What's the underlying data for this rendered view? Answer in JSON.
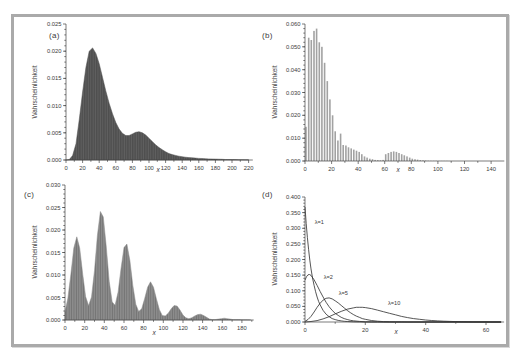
{
  "figure": {
    "background_color": "#ffffff",
    "frame_color": "#aaaaaa",
    "axis_color": "#444444",
    "text_color": "#3a3a3a"
  },
  "chart_data": [
    {
      "id": "a",
      "panel_label": "(a)",
      "type": "bar",
      "render": "area",
      "xlabel": "x",
      "ylabel": "Wahrscheinlichkeit",
      "xlim": [
        0,
        225
      ],
      "ylim": [
        0,
        0.025
      ],
      "xticks": [
        0,
        20,
        40,
        60,
        80,
        100,
        120,
        140,
        160,
        180,
        200,
        220
      ],
      "xticklabels": [
        "0",
        "20",
        "40",
        "60",
        "80",
        "100",
        "120",
        "140",
        "160",
        "180",
        "200",
        "220"
      ],
      "yticks": [
        0,
        0.005,
        0.01,
        0.015,
        0.02,
        0.025
      ],
      "yticklabels": [
        "0.000",
        "0.005",
        "0.010",
        "0.015",
        "0.020",
        "0.025"
      ],
      "bar_color": "#4f4f4f",
      "bar_stripe_color": "#636363",
      "x_step": 4,
      "x": [
        0,
        4,
        8,
        12,
        16,
        20,
        24,
        28,
        32,
        36,
        40,
        44,
        48,
        52,
        56,
        60,
        64,
        68,
        72,
        76,
        80,
        84,
        88,
        92,
        96,
        100,
        104,
        108,
        112,
        116,
        120,
        124,
        128,
        132,
        136,
        140,
        144,
        148,
        152,
        156,
        160,
        164,
        168,
        172,
        176,
        180,
        184,
        188,
        192,
        196,
        200,
        204,
        208,
        212,
        216,
        220
      ],
      "y": [
        0,
        0.0001,
        0.0008,
        0.003,
        0.0075,
        0.0125,
        0.017,
        0.02,
        0.0206,
        0.0196,
        0.0177,
        0.0152,
        0.0127,
        0.0104,
        0.0085,
        0.0069,
        0.0057,
        0.0049,
        0.0045,
        0.0045,
        0.0048,
        0.0051,
        0.0052,
        0.005,
        0.0046,
        0.004,
        0.0034,
        0.0028,
        0.0023,
        0.0019,
        0.0015,
        0.0012,
        0.001,
        0.00085,
        0.0007,
        0.0006,
        0.00052,
        0.00045,
        0.0004,
        0.00035,
        0.0003,
        0.00027,
        0.00024,
        0.00021,
        0.00018,
        0.00016,
        0.00014,
        0.00012,
        0.0001,
        9e-05,
        8e-05,
        7e-05,
        6e-05,
        5e-05,
        4e-05,
        3e-05
      ]
    },
    {
      "id": "b",
      "panel_label": "(b)",
      "type": "bar",
      "render": "bars",
      "xlabel": "x",
      "ylabel": "Wahrscheinlichkeit",
      "xlim": [
        0,
        150
      ],
      "ylim": [
        0,
        0.06
      ],
      "xticks": [
        0,
        20,
        40,
        60,
        80,
        100,
        120,
        140
      ],
      "xticklabels": [
        "0",
        "20",
        "40",
        "60",
        "80",
        "100",
        "120",
        "140"
      ],
      "yticks": [
        0,
        0.01,
        0.02,
        0.03,
        0.04,
        0.05,
        0.06
      ],
      "yticklabels": [
        "0.000",
        "0.010",
        "0.020",
        "0.030",
        "0.040",
        "0.050",
        "0.060"
      ],
      "bar_color": "#a2a2a2",
      "x_step": 2,
      "x": [
        0,
        2,
        4,
        6,
        8,
        10,
        12,
        14,
        16,
        18,
        20,
        22,
        24,
        26,
        28,
        30,
        32,
        34,
        36,
        38,
        40,
        42,
        44,
        46,
        48,
        50,
        52,
        54,
        56,
        58,
        60,
        62,
        64,
        66,
        68,
        70,
        72,
        74,
        76,
        78,
        80,
        82,
        84,
        86,
        88,
        90,
        92,
        94,
        96,
        98,
        100,
        102,
        104,
        106,
        108,
        110,
        112,
        114,
        116,
        118,
        120,
        122,
        124,
        126,
        128,
        130,
        132,
        134,
        136,
        138,
        140,
        142,
        144,
        146,
        148,
        150
      ],
      "y": [
        0.015,
        0.054,
        0.053,
        0.057,
        0.058,
        0.052,
        0.05,
        0.043,
        0.035,
        0.027,
        0.02,
        0.013,
        0.009,
        0.012,
        0.007,
        0.0068,
        0.006,
        0.0055,
        0.005,
        0.0045,
        0.004,
        0.003,
        0.002,
        0.0015,
        0.001,
        0.0008,
        0.0005,
        0.0004,
        0.0003,
        0.0005,
        0.003,
        0.0035,
        0.004,
        0.0042,
        0.004,
        0.0035,
        0.003,
        0.0025,
        0.002,
        0.0015,
        0.001,
        0.0008,
        0.0006,
        0.0004,
        0.0003,
        0.0002,
        0.00015,
        0.0001,
        0.0001,
        8e-05,
        6e-05,
        5e-05,
        4e-05,
        3e-05,
        2e-05,
        2e-05,
        1e-05,
        1e-05,
        0,
        0,
        0,
        0,
        0,
        0,
        0,
        0,
        0,
        0,
        0,
        0,
        0,
        0,
        0,
        0,
        0,
        0
      ]
    },
    {
      "id": "c",
      "panel_label": "(c)",
      "type": "bar",
      "render": "area",
      "xlabel": "x",
      "ylabel": "Wahrscheinlichkeit",
      "xlim": [
        0,
        192
      ],
      "ylim": [
        0,
        0.03
      ],
      "xticks": [
        0,
        20,
        40,
        60,
        80,
        100,
        120,
        140,
        160,
        180
      ],
      "xticklabels": [
        "0",
        "20",
        "40",
        "60",
        "80",
        "100",
        "120",
        "140",
        "160",
        "180"
      ],
      "yticks": [
        0,
        0.005,
        0.01,
        0.015,
        0.02,
        0.025,
        0.03
      ],
      "yticklabels": [
        "0.000",
        "0.005",
        "0.010",
        "0.015",
        "0.020",
        "0.025",
        "0.030"
      ],
      "bar_color": "#8d8d8d",
      "bar_stripe_color": "#6f6f6f",
      "x_step": 3,
      "x": [
        0,
        3,
        6,
        9,
        12,
        15,
        18,
        21,
        24,
        27,
        30,
        33,
        36,
        39,
        42,
        45,
        48,
        51,
        54,
        57,
        60,
        63,
        66,
        69,
        72,
        75,
        78,
        81,
        84,
        87,
        90,
        93,
        96,
        99,
        102,
        105,
        108,
        111,
        114,
        117,
        120,
        123,
        126,
        129,
        132,
        135,
        138,
        141,
        144,
        147,
        150,
        153,
        156,
        159,
        162,
        165,
        168,
        171,
        174,
        177,
        180,
        183,
        186,
        189
      ],
      "y": [
        0.0017,
        0.0049,
        0.0102,
        0.016,
        0.0185,
        0.016,
        0.0102,
        0.0052,
        0.0032,
        0.0051,
        0.011,
        0.0188,
        0.0241,
        0.0229,
        0.0162,
        0.0086,
        0.004,
        0.0033,
        0.0062,
        0.0114,
        0.0161,
        0.0169,
        0.0132,
        0.0077,
        0.0035,
        0.0019,
        0.0025,
        0.0047,
        0.0073,
        0.0085,
        0.0073,
        0.0047,
        0.0023,
        0.001,
        0.0009,
        0.0015,
        0.0025,
        0.0032,
        0.0031,
        0.0022,
        0.0011,
        0.0005,
        0.0003,
        0.0005,
        0.0009,
        0.0012,
        0.0013,
        0.001,
        0.0006,
        0.0002,
        0.0001,
        0.0001,
        0.0002,
        0.0003,
        0.0004,
        0.0003,
        0.0002,
        0.0001,
        0.0001,
        8e-05,
        6e-05,
        5e-05,
        4e-05,
        3e-05
      ]
    },
    {
      "id": "d",
      "panel_label": "(d)",
      "type": "line",
      "render": "lines",
      "xlabel": "x",
      "ylabel": "Wahrscheinlichkeit",
      "xlim": [
        0,
        66
      ],
      "ylim": [
        0,
        0.4
      ],
      "xticks": [
        0,
        20,
        40,
        60
      ],
      "xticklabels": [
        "0",
        "20",
        "40",
        "60"
      ],
      "yticks": [
        0,
        0.05,
        0.1,
        0.15,
        0.2,
        0.25,
        0.3,
        0.35,
        0.4
      ],
      "yticklabels": [
        "0.000",
        "0.050",
        "0.100",
        "0.150",
        "0.200",
        "0.250",
        "0.300",
        "0.350",
        "0.400"
      ],
      "line_color": "#2b2b2b",
      "series": [
        {
          "name": "λ=1",
          "points": [
            [
              0,
              0.368
            ],
            [
              0.4,
              0.315
            ],
            [
              0.8,
              0.27
            ],
            [
              1.2,
              0.232
            ],
            [
              1.6,
              0.198
            ],
            [
              2,
              0.17
            ],
            [
              2.5,
              0.141
            ],
            [
              3,
              0.117
            ],
            [
              3.5,
              0.097
            ],
            [
              4,
              0.08
            ],
            [
              4.5,
              0.066
            ],
            [
              5,
              0.055
            ],
            [
              6,
              0.037
            ],
            [
              7,
              0.025
            ],
            [
              8,
              0.017
            ],
            [
              9,
              0.011
            ],
            [
              10,
              0.0076
            ],
            [
              11,
              0.0051
            ],
            [
              12,
              0.0034
            ],
            [
              13,
              0.0023
            ],
            [
              14,
              0.0015
            ],
            [
              16,
              0.0007
            ],
            [
              18,
              0.0003
            ],
            [
              20,
              0.00014
            ],
            [
              24,
              5e-05
            ],
            [
              30,
              0
            ],
            [
              65,
              0
            ]
          ]
        },
        {
          "name": "λ=2",
          "points": [
            [
              0,
              0.134
            ],
            [
              0.5,
              0.145
            ],
            [
              1,
              0.151
            ],
            [
              1.5,
              0.152
            ],
            [
              2,
              0.149
            ],
            [
              3,
              0.135
            ],
            [
              4,
              0.117
            ],
            [
              5,
              0.098
            ],
            [
              6,
              0.08
            ],
            [
              7,
              0.063
            ],
            [
              8,
              0.049
            ],
            [
              9,
              0.037
            ],
            [
              10,
              0.028
            ],
            [
              11,
              0.021
            ],
            [
              12,
              0.015
            ],
            [
              13,
              0.011
            ],
            [
              14,
              0.008
            ],
            [
              15,
              0.0055
            ],
            [
              16,
              0.004
            ],
            [
              18,
              0.0018
            ],
            [
              20,
              0.0008
            ],
            [
              22,
              0.0004
            ],
            [
              24,
              0.0002
            ],
            [
              26,
              0.0001
            ],
            [
              28,
              0
            ],
            [
              65,
              0
            ]
          ]
        },
        {
          "name": "λ=5",
          "points": [
            [
              0,
              0.002
            ],
            [
              1,
              0.008
            ],
            [
              2,
              0.018
            ],
            [
              3,
              0.032
            ],
            [
              4,
              0.047
            ],
            [
              5,
              0.06
            ],
            [
              6,
              0.07
            ],
            [
              7,
              0.076
            ],
            [
              8,
              0.077
            ],
            [
              9,
              0.074
            ],
            [
              10,
              0.068
            ],
            [
              11,
              0.061
            ],
            [
              12,
              0.053
            ],
            [
              13,
              0.045
            ],
            [
              14,
              0.037
            ],
            [
              15,
              0.03
            ],
            [
              16,
              0.024
            ],
            [
              17,
              0.019
            ],
            [
              18,
              0.015
            ],
            [
              19,
              0.011
            ],
            [
              20,
              0.0085
            ],
            [
              22,
              0.0048
            ],
            [
              24,
              0.0026
            ],
            [
              26,
              0.0014
            ],
            [
              28,
              0.0007
            ],
            [
              30,
              0.0004
            ],
            [
              32,
              0.0002
            ],
            [
              34,
              0.0001
            ],
            [
              36,
              0
            ],
            [
              65,
              0
            ]
          ]
        },
        {
          "name": "λ=10",
          "points": [
            [
              0,
              0
            ],
            [
              2,
              0.0015
            ],
            [
              4,
              0.0045
            ],
            [
              6,
              0.01
            ],
            [
              8,
              0.017
            ],
            [
              10,
              0.026
            ],
            [
              12,
              0.034
            ],
            [
              14,
              0.041
            ],
            [
              16,
              0.045
            ],
            [
              17,
              0.047
            ],
            [
              18,
              0.047
            ],
            [
              19,
              0.047
            ],
            [
              20,
              0.046
            ],
            [
              22,
              0.043
            ],
            [
              24,
              0.038
            ],
            [
              26,
              0.033
            ],
            [
              28,
              0.028
            ],
            [
              30,
              0.023
            ],
            [
              32,
              0.018
            ],
            [
              34,
              0.014
            ],
            [
              36,
              0.011
            ],
            [
              38,
              0.0085
            ],
            [
              40,
              0.0065
            ],
            [
              42,
              0.0048
            ],
            [
              44,
              0.0035
            ],
            [
              46,
              0.0025
            ],
            [
              48,
              0.0018
            ],
            [
              50,
              0.0013
            ],
            [
              52,
              0.0009
            ],
            [
              54,
              0.0006
            ],
            [
              56,
              0.0004
            ],
            [
              58,
              0.0003
            ],
            [
              60,
              0.0002
            ],
            [
              62,
              0.0001
            ],
            [
              65,
              0
            ]
          ]
        }
      ],
      "annotations": [
        {
          "text": "λ=1",
          "x": 3.2,
          "y": 0.315
        },
        {
          "text": "λ=2",
          "x": 6.2,
          "y": 0.138
        },
        {
          "text": "λ=5",
          "x": 11.2,
          "y": 0.085
        },
        {
          "text": "λ=10",
          "x": 27.5,
          "y": 0.055
        }
      ]
    }
  ]
}
